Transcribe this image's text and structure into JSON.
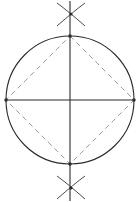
{
  "figure": {
    "background_color": "#ffffff",
    "canvas": {
      "width": 140,
      "height": 202
    }
  },
  "style": {
    "solid_stroke_color": "#2a2a2a",
    "dashed_stroke_color": "#9a9a9a",
    "arc_stroke_color": "#4a4a4a",
    "solid_stroke_width": 1.1,
    "dashed_stroke_width": 1.0,
    "arc_stroke_width": 1.0,
    "dash_pattern": "5,4"
  },
  "geometry": {
    "circle": {
      "center_x": 70,
      "center_y": 100,
      "radius": 64,
      "label": "construction-circle"
    },
    "vertical_axis": {
      "x": 70,
      "y1": 1,
      "y2": 201,
      "label": "vertical-diameter"
    },
    "horizontal_axis": {
      "y": 100,
      "x1": 6,
      "x2": 134,
      "label": "horizontal-diameter"
    },
    "vertices": {
      "top": {
        "x": 70,
        "y": 36
      },
      "right": {
        "x": 134,
        "y": 100
      },
      "bottom": {
        "x": 70,
        "y": 164
      },
      "left": {
        "x": 6,
        "y": 100
      }
    },
    "inscribed_square_path": "M 70 36 L 134 100 L 70 164 L 6 100 Z",
    "arc_marks": [
      {
        "name": "top-arc-intersection",
        "intersection_x": 71,
        "intersection_y": 14,
        "arcs": [
          {
            "d": "M 57 3 Q 68 11 85 26"
          },
          {
            "d": "M 85 3 Q 74 11 57 26"
          }
        ]
      },
      {
        "name": "bottom-arc-intersection",
        "intersection_x": 71,
        "intersection_y": 188,
        "arcs": [
          {
            "d": "M 57 176 Q 68 184 85 199"
          },
          {
            "d": "M 85 176 Q 74 184 57 199"
          }
        ]
      }
    ]
  }
}
